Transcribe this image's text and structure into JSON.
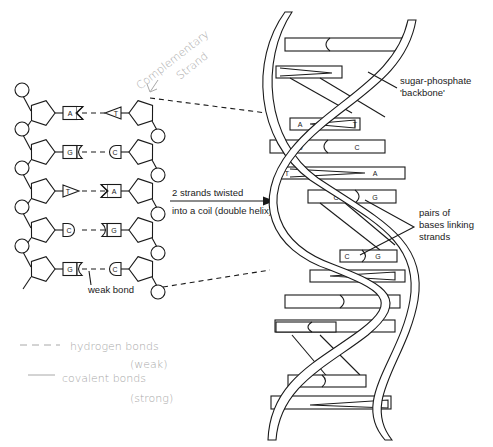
{
  "figure": {
    "stroke_color": "#1a1a1a",
    "annotation_color": "#a8a8a8",
    "background": "#ffffff"
  },
  "strand_diagram": {
    "rows": [
      {
        "left_base": "A",
        "left_shape": "notch",
        "right_base": "T",
        "right_shape": "triangle"
      },
      {
        "left_base": "G",
        "left_shape": "cup",
        "right_base": "C",
        "right_shape": "round"
      },
      {
        "left_base": "T",
        "left_shape": "triangle",
        "right_base": "A",
        "right_shape": "notch"
      },
      {
        "left_base": "C",
        "left_shape": "round",
        "right_base": "G",
        "right_shape": "cup"
      },
      {
        "left_base": "G",
        "left_shape": "cup",
        "right_base": "C",
        "right_shape": "round"
      }
    ],
    "weak_bond_label": "weak bond"
  },
  "arrow": {
    "line1": "2 strands twisted",
    "line2": "into a coil (double helix)"
  },
  "helix": {
    "backbone_label_line1": "sugar-phosphate",
    "backbone_label_line2": "'backbone'",
    "pairs_label_line1": "pairs of",
    "pairs_label_line2": "bases linking",
    "pairs_label_line3": "strands",
    "visible_pairs": [
      {
        "left": "A",
        "right": "T"
      },
      {
        "left": "G",
        "right": "C"
      },
      {
        "left": "T",
        "right": "A"
      },
      {
        "left": "C",
        "right": "G"
      },
      {
        "left": "C",
        "right": "G"
      }
    ]
  },
  "handwritten_notes": {
    "complementary_line1": "Complementary",
    "complementary_line2": "Strand",
    "legend_dashed": "hydrogen bonds",
    "legend_dashed_sub": "(weak)",
    "legend_solid": "covalent bonds",
    "legend_solid_sub": "(strong)"
  }
}
